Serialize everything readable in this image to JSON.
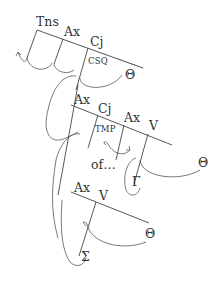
{
  "diagram": {
    "tree1": {
      "nodes": [
        "Tns",
        "Ax",
        "Cj"
      ],
      "feature": "CSQ",
      "target": "Θ"
    },
    "tree2": {
      "nodes": [
        "Ax",
        "Cj",
        "Ax",
        "V"
      ],
      "feature": "TMP",
      "annotation": "of…",
      "target": "Θ",
      "subject": "Γ"
    },
    "tree3": {
      "nodes": [
        "Ax",
        "V"
      ],
      "target": "Θ",
      "subject": "Σ"
    },
    "colors": {
      "line": "#444444",
      "text": "#333333",
      "background": "#ffffff"
    }
  }
}
